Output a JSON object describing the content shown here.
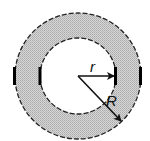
{
  "diagram": {
    "type": "annulus",
    "center": {
      "x": 78,
      "y": 76
    },
    "inner_radius_px": 38,
    "outer_radius_px": 63,
    "fill_color": "#c8c8c8",
    "stroke_color": "#1a1a1a",
    "labels": {
      "inner_radius": "r",
      "outer_radius": "R"
    },
    "arrows": [
      {
        "name": "inner-radius-arrow",
        "label": "r",
        "to": {
          "x": 114,
          "y": 76
        }
      },
      {
        "name": "outer-radius-arrow",
        "label": "R",
        "to": {
          "x": 121,
          "y": 121
        }
      }
    ]
  }
}
